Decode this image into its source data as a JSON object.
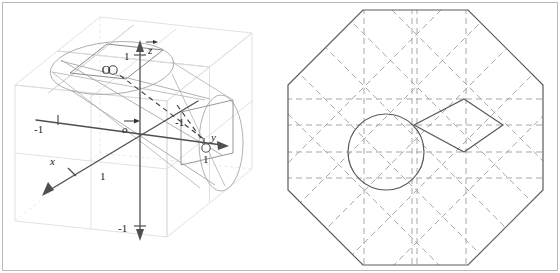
{
  "figure": {
    "frame_color": "#b9b9b9",
    "background": "#ffffff"
  },
  "left_panel": {
    "name": "3d-coordinate-cone-diagram",
    "description": "Three dimensional axonometric view of a unit cube grid containing a cone and an ellipse cross-section",
    "colors": {
      "cube_grid": "#d6d6d6",
      "cube_grid_dashed": "#dcdcdc",
      "axis": "#555555",
      "shape_outline": "#9a9a9a",
      "dashed_construction": "#4a4a4a",
      "label": "#333333"
    },
    "axes": [
      {
        "id": "x-axis",
        "label": "x",
        "positive_tick_label": "1",
        "direction": "lower-left"
      },
      {
        "id": "y-axis",
        "label": "y",
        "positive_tick_label": "1",
        "negative_tick_label": "-1",
        "direction": "right"
      },
      {
        "id": "z-axis",
        "label": "z",
        "positive_tick_label": "1",
        "negative_tick_label": "-1",
        "direction": "up"
      }
    ],
    "origin_label": "o",
    "interior_point_label": "O",
    "negative_unit_label": "-1",
    "labels": {
      "z": "z",
      "y": "y",
      "x": "x",
      "one": "1",
      "minus_one": "-1",
      "origin": "o",
      "point_o": "O"
    }
  },
  "right_panel": {
    "name": "octagon-projection-diagram",
    "description": "Regular octagon outline with dashed orthogonal and diagonal construction grid, an inscribed circle and a rotated square",
    "colors": {
      "octagon_outline": "#5a5a5a",
      "dashed_grid": "#9e9e9e",
      "dashed_diagonal": "#a8a8a8",
      "circle_outline": "#5a5a5a",
      "square_outline": "#5a5a5a"
    },
    "shapes": [
      {
        "id": "octagon",
        "sides": 8,
        "style": "solid"
      },
      {
        "id": "circle",
        "style": "solid"
      },
      {
        "id": "rotated-square",
        "style": "solid"
      },
      {
        "id": "horizontal-grid-lines",
        "count": 4,
        "style": "dashed"
      },
      {
        "id": "vertical-grid-lines",
        "count": 4,
        "style": "dashed"
      },
      {
        "id": "double-center-vertical",
        "count": 2,
        "style": "dashed"
      },
      {
        "id": "diagonal-grid-lines",
        "count": 8,
        "style": "dashed"
      }
    ]
  }
}
